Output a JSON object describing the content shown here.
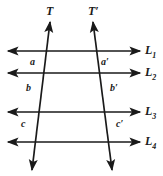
{
  "figure": {
    "type": "geometry-diagram",
    "stroke_color": "#1a1a1a",
    "background_color": "#ffffff"
  },
  "parallel_lines": [
    {
      "id": "L1",
      "base": "L",
      "sub": "1",
      "label": "L",
      "y": 51,
      "x_start": 8,
      "x_end": 140
    },
    {
      "id": "L2",
      "base": "L",
      "sub": "2",
      "label": "L",
      "y": 73,
      "x_start": 8,
      "x_end": 140
    },
    {
      "id": "L3",
      "base": "L",
      "sub": "3",
      "label": "L",
      "y": 112,
      "x_start": 8,
      "x_end": 140
    },
    {
      "id": "L4",
      "base": "L",
      "sub": "4",
      "label": "L",
      "y": 142,
      "x_start": 8,
      "x_end": 140
    }
  ],
  "line_labels": [
    {
      "text": "L",
      "sub": "1",
      "x": 145,
      "y": 44
    },
    {
      "text": "L",
      "sub": "2",
      "x": 145,
      "y": 66
    },
    {
      "text": "L",
      "sub": "3",
      "x": 145,
      "y": 105
    },
    {
      "text": "L",
      "sub": "4",
      "x": 145,
      "y": 135
    }
  ],
  "transversals": [
    {
      "id": "T",
      "label": "T",
      "x_top": 50,
      "y_top": 22,
      "x_bottom": 32,
      "y_bottom": 170,
      "label_x": 46,
      "label_y": 5
    },
    {
      "id": "Tprime",
      "label": "T′",
      "x_top": 93,
      "y_top": 22,
      "x_bottom": 112,
      "y_bottom": 170,
      "label_x": 88,
      "label_y": 5
    }
  ],
  "segment_labels": [
    {
      "text": "a",
      "x": 30,
      "y": 57
    },
    {
      "text": "b",
      "x": 26,
      "y": 83
    },
    {
      "text": "c",
      "x": 21,
      "y": 119
    },
    {
      "text": "a′",
      "x": 101,
      "y": 57
    },
    {
      "text": "b′",
      "x": 110,
      "y": 83
    },
    {
      "text": "c′",
      "x": 116,
      "y": 119
    }
  ]
}
